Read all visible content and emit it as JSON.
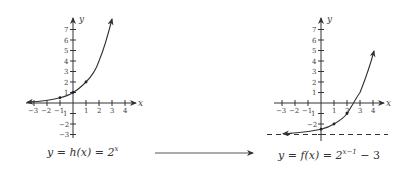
{
  "left_graph": {
    "function_label": "y = h(x) = 2^x",
    "caption_parts": {
      "lhs": "y = h(x) = 2",
      "exp": "x"
    },
    "x_axis_label": "x",
    "y_axis_label": "y",
    "x_ticks": [
      "-3",
      "-2",
      "-1",
      "1",
      "2",
      "3",
      "4"
    ],
    "y_ticks": [
      "7",
      "6",
      "5",
      "4",
      "3",
      "2",
      "1",
      "-1",
      "-2",
      "-3"
    ],
    "points": [
      [
        -1,
        0.5
      ],
      [
        0,
        1
      ],
      [
        1,
        2
      ]
    ],
    "curve_end": [
      3,
      8
    ],
    "asymptote": "y = 0"
  },
  "right_graph": {
    "function_label": "y = f(x) = 2^(x-1) - 3",
    "caption_parts": {
      "lhs": "y = f(x) = 2",
      "exp": "x−1",
      "rhs": " − 3"
    },
    "x_axis_label": "x",
    "y_axis_label": "y",
    "x_ticks": [
      "-3",
      "-2",
      "-1",
      "1",
      "2",
      "3",
      "4"
    ],
    "y_ticks": [
      "7",
      "6",
      "5",
      "4",
      "3",
      "2",
      "1",
      "-1",
      "-2"
    ],
    "points": [
      [
        0,
        -2.5
      ],
      [
        1,
        -2
      ],
      [
        2,
        -1
      ]
    ],
    "curve_end": [
      4,
      5
    ],
    "asymptote": "y = -3"
  },
  "transform_arrow": "→"
}
